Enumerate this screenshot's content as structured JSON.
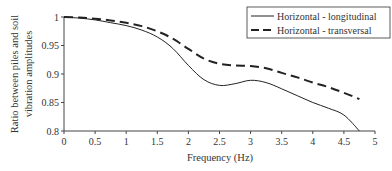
{
  "chart_data": {
    "type": "line",
    "title": "",
    "xlabel": "Frequency (Hz)",
    "ylabel_lines": [
      "Ratio between piles and soil",
      "vibration amplitudes"
    ],
    "ylabel": "Ratio between piles and soil vibration amplitudes",
    "xlim": [
      0,
      5
    ],
    "ylim": [
      0.8,
      1.0
    ],
    "x_ticks": [
      "0",
      "0.5",
      "1",
      "1.5",
      "2",
      "2.5",
      "3",
      "3.5",
      "4",
      "4.5",
      "5"
    ],
    "y_ticks": [
      "0.8",
      "0.85",
      "0.9",
      "0.95",
      "1"
    ],
    "grid": false,
    "legend_position": "top-right",
    "series": [
      {
        "name": "Horizontal - longitudinal",
        "style": "solid",
        "x": [
          0,
          0.25,
          0.5,
          0.75,
          1.0,
          1.25,
          1.5,
          1.75,
          2.0,
          2.25,
          2.5,
          2.75,
          3.0,
          3.25,
          3.5,
          3.75,
          4.0,
          4.25,
          4.5,
          4.75
        ],
        "values": [
          1.0,
          0.998,
          0.995,
          0.99,
          0.985,
          0.977,
          0.965,
          0.945,
          0.915,
          0.89,
          0.88,
          0.883,
          0.889,
          0.885,
          0.874,
          0.862,
          0.85,
          0.84,
          0.828,
          0.8
        ]
      },
      {
        "name": "Horizontal - transversal",
        "style": "dashed",
        "x": [
          0,
          0.25,
          0.5,
          0.75,
          1.0,
          1.25,
          1.5,
          1.75,
          2.0,
          2.25,
          2.5,
          2.75,
          3.0,
          3.25,
          3.5,
          3.75,
          4.0,
          4.25,
          4.5,
          4.75
        ],
        "values": [
          1.0,
          0.999,
          0.997,
          0.994,
          0.99,
          0.984,
          0.975,
          0.962,
          0.944,
          0.927,
          0.918,
          0.915,
          0.914,
          0.91,
          0.902,
          0.894,
          0.885,
          0.877,
          0.867,
          0.856
        ]
      }
    ]
  },
  "colors": {
    "line": "#222222",
    "axis": "#444444",
    "background": "#ffffff"
  }
}
